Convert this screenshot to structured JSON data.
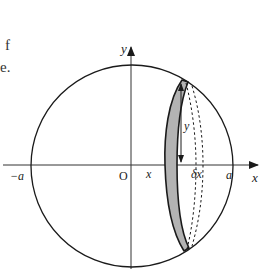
{
  "caption": {
    "line1": "f",
    "line2": "e."
  },
  "labels": {
    "y_axis": "y",
    "x_axis": "x",
    "origin": "O",
    "neg_a": "−a",
    "pos_a": "a",
    "x_pos": "x",
    "y_height": "y",
    "delta_x": "δx"
  },
  "colors": {
    "line": "#1a1a1a",
    "strip_fill": "#b3b3b3",
    "axis": "#333333",
    "background": "#ffffff"
  }
}
